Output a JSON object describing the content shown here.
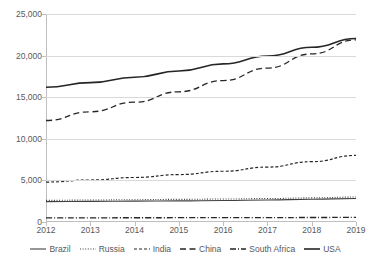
{
  "chart_data": {
    "type": "line",
    "title": "",
    "xlabel": "",
    "ylabel": "",
    "x": [
      2012,
      2013,
      2014,
      2015,
      2016,
      2017,
      2018,
      2019
    ],
    "categories": [
      "2012",
      "2013",
      "2014",
      "2015",
      "2016",
      "2017",
      "2018",
      "2019"
    ],
    "ylim": [
      0,
      25000
    ],
    "ytick_values": [
      0,
      5000,
      10000,
      15000,
      20000,
      25000
    ],
    "ytick_labels": [
      "0",
      "5,000",
      "10,000",
      "15,000",
      "20,000",
      "25,000"
    ],
    "grid": true,
    "legend_position": "bottom",
    "series": [
      {
        "name": "Brazil",
        "style": "solid",
        "color": "#404040",
        "values": [
          2450,
          2480,
          2510,
          2540,
          2580,
          2640,
          2730,
          2830
        ]
      },
      {
        "name": "Russia",
        "style": "dotted",
        "color": "#404040",
        "values": [
          2600,
          2640,
          2680,
          2720,
          2760,
          2820,
          2900,
          3000
        ]
      },
      {
        "name": "India",
        "style": "dashed-short",
        "color": "#262626",
        "values": [
          4800,
          5050,
          5350,
          5700,
          6100,
          6600,
          7250,
          8000
        ]
      },
      {
        "name": "China",
        "style": "dashed-long",
        "color": "#262626",
        "values": [
          12200,
          13250,
          14400,
          15650,
          17000,
          18500,
          20200,
          21900
        ]
      },
      {
        "name": "South Africa",
        "style": "dash-dot",
        "color": "#262626",
        "values": [
          500,
          505,
          510,
          515,
          520,
          530,
          540,
          550
        ]
      },
      {
        "name": "USA",
        "style": "solid-thick",
        "color": "#262626",
        "values": [
          16200,
          16750,
          17400,
          18150,
          19000,
          19950,
          21000,
          22050
        ]
      }
    ]
  },
  "legend": {
    "items": [
      {
        "label": "Brazil"
      },
      {
        "label": "Russia"
      },
      {
        "label": "India"
      },
      {
        "label": "China"
      },
      {
        "label": "South Africa"
      },
      {
        "label": "USA"
      }
    ]
  }
}
